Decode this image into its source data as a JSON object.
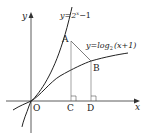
{
  "diagram": {
    "type": "function-graph",
    "axes": {
      "x_label": "x",
      "y_label": "y",
      "origin_label": "O"
    },
    "curves": [
      {
        "name": "exponential",
        "equation": "y=2^x−1",
        "label_prefix": "y=2",
        "label_exp": "x",
        "label_suffix": "−1"
      },
      {
        "name": "logarithm",
        "equation": "y=log₂(x+1)",
        "label_prefix": "y=log",
        "label_sub": "2",
        "label_suffix": "(x+1)"
      }
    ],
    "points": [
      {
        "label": "A",
        "x": 2,
        "y": 3
      },
      {
        "label": "B",
        "x": 3,
        "y": 2
      },
      {
        "label": "C",
        "x": 2,
        "y": 0
      },
      {
        "label": "D",
        "x": 3,
        "y": 0
      }
    ],
    "colors": {
      "stroke": "#222222",
      "thin_stroke": "#555555",
      "background": "#ffffff"
    }
  }
}
